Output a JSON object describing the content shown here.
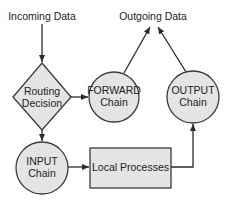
{
  "diagram": {
    "type": "flowchart",
    "colors": {
      "node_fill": "#e4e4e4",
      "stroke": "#3a3a3a",
      "text": "#222222",
      "background": "#ffffff"
    },
    "labels": {
      "incoming": "Incoming Data",
      "outgoing": "Outgoing Data"
    },
    "nodes": {
      "routing": {
        "shape": "diamond",
        "line1": "Routing",
        "line2": "Decision"
      },
      "forward": {
        "shape": "circle",
        "line1": "FORWARD",
        "line2": "Chain"
      },
      "output": {
        "shape": "circle",
        "line1": "OUTPUT",
        "line2": "Chain"
      },
      "input": {
        "shape": "circle",
        "line1": "INPUT",
        "line2": "Chain"
      },
      "local": {
        "shape": "rectangle",
        "line1": "Local Processes"
      }
    },
    "edges": [
      {
        "from": "Incoming Data",
        "to": "Routing Decision"
      },
      {
        "from": "Routing Decision",
        "to": "FORWARD Chain"
      },
      {
        "from": "Routing Decision",
        "to": "INPUT Chain"
      },
      {
        "from": "INPUT Chain",
        "to": "Local Processes"
      },
      {
        "from": "Local Processes",
        "to": "OUTPUT Chain"
      },
      {
        "from": "FORWARD Chain",
        "to": "Outgoing Data"
      },
      {
        "from": "OUTPUT Chain",
        "to": "Outgoing Data"
      }
    ]
  }
}
